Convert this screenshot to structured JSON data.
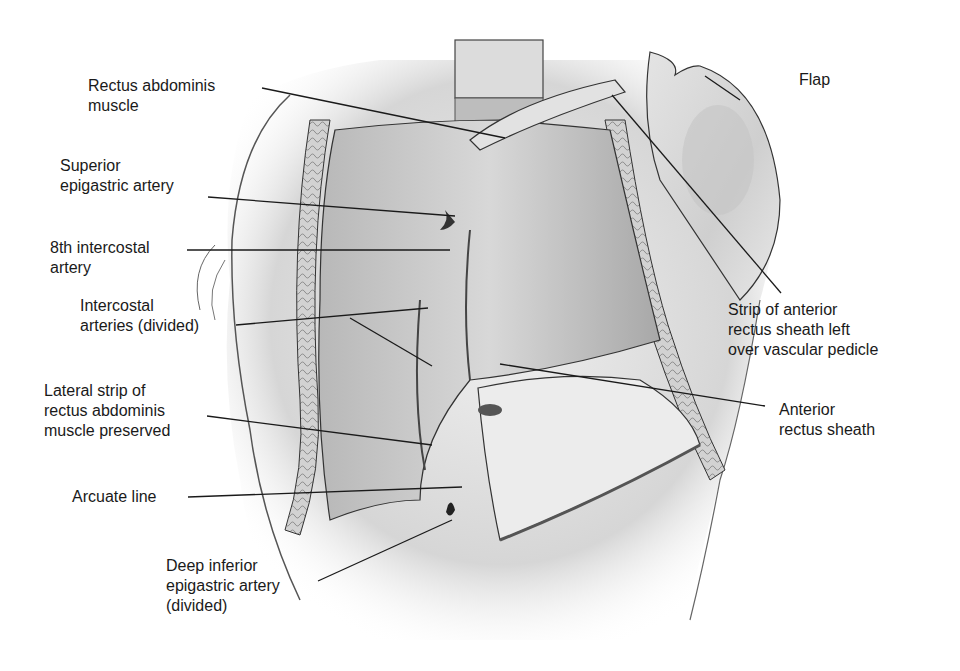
{
  "figure": {
    "labels": {
      "rectus_abdominis": {
        "line1": "Rectus abdominis",
        "line2": "muscle"
      },
      "superior_epigastric": {
        "line1": "Superior",
        "line2": "epigastric artery"
      },
      "eighth_intercostal": {
        "line1": "8th intercostal",
        "line2": "artery"
      },
      "intercostal_divided": {
        "line1": "Intercostal",
        "line2": "arteries (divided)"
      },
      "lateral_strip": {
        "line1": "Lateral strip of",
        "line2": "rectus abdominis",
        "line3": "muscle preserved"
      },
      "arcuate_line": {
        "line1": "Arcuate line"
      },
      "deep_inferior": {
        "line1": "Deep inferior",
        "line2": "epigastric artery",
        "line3": "(divided)"
      },
      "flap": {
        "line1": "Flap"
      },
      "strip_anterior": {
        "line1": "Strip of anterior",
        "line2": "rectus sheath left",
        "line3": "over vascular pedicle"
      },
      "anterior_sheath": {
        "line1": "Anterior",
        "line2": "rectus sheath"
      }
    },
    "colors": {
      "background": "#ffffff",
      "ink": "#1a1a1a",
      "skin_light": "#e6e6e6",
      "skin_mid": "#c8c8c8",
      "skin_dark": "#8a8a8a"
    }
  }
}
